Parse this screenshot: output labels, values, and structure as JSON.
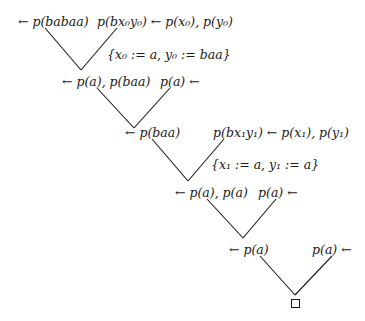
{
  "diagram": {
    "type": "SLD-refutation-tree",
    "nodes": [
      {
        "id": "goal0",
        "text": "← p(babaa)",
        "x": 18,
        "y": 15
      },
      {
        "id": "clause0",
        "text": "p(bx₀y₀) ← p(x₀), p(y₀)",
        "x": 97,
        "y": 15
      },
      {
        "id": "subst0",
        "text": "{x₀ := a, y₀ := baa}",
        "x": 107,
        "y": 48
      },
      {
        "id": "goal1",
        "text": "← p(a), p(baa)",
        "x": 62,
        "y": 75
      },
      {
        "id": "fact1",
        "text": "p(a) ←",
        "x": 160,
        "y": 75
      },
      {
        "id": "goal2",
        "text": "← p(baa)",
        "x": 125,
        "y": 126
      },
      {
        "id": "clause2",
        "text": "p(bx₁y₁) ← p(x₁), p(y₁)",
        "x": 213,
        "y": 126
      },
      {
        "id": "subst2",
        "text": "{x₁ := a, y₁ := a}",
        "x": 211,
        "y": 158
      },
      {
        "id": "goal3",
        "text": "← p(a), p(a)",
        "x": 175,
        "y": 186
      },
      {
        "id": "fact3",
        "text": "p(a) ←",
        "x": 258,
        "y": 186
      },
      {
        "id": "goal4",
        "text": "← p(a)",
        "x": 229,
        "y": 243
      },
      {
        "id": "fact4",
        "text": "p(a) ←",
        "x": 312,
        "y": 243
      }
    ],
    "edges": [
      {
        "from": "goal0",
        "to": "goal1",
        "x1": 45,
        "y1": 28,
        "x2": 81,
        "y2": 70
      },
      {
        "from": "clause0",
        "to": "goal1",
        "x1": 117,
        "y1": 28,
        "x2": 81,
        "y2": 70
      },
      {
        "from": "goal1",
        "to": "goal2",
        "x1": 97,
        "y1": 88,
        "x2": 134,
        "y2": 128
      },
      {
        "from": "fact1",
        "to": "goal2",
        "x1": 170,
        "y1": 88,
        "x2": 134,
        "y2": 128
      },
      {
        "from": "goal2",
        "to": "goal3",
        "x1": 152,
        "y1": 139,
        "x2": 188,
        "y2": 181
      },
      {
        "from": "clause2",
        "to": "goal3",
        "x1": 224,
        "y1": 139,
        "x2": 188,
        "y2": 181
      },
      {
        "from": "goal3",
        "to": "goal4",
        "x1": 207,
        "y1": 199,
        "x2": 243,
        "y2": 238
      },
      {
        "from": "fact3",
        "to": "goal4",
        "x1": 276,
        "y1": 199,
        "x2": 243,
        "y2": 238
      },
      {
        "from": "goal4",
        "to": "empty",
        "x1": 260,
        "y1": 256,
        "x2": 295,
        "y2": 295
      },
      {
        "from": "fact4",
        "to": "empty",
        "x1": 332,
        "y1": 256,
        "x2": 295,
        "y2": 295
      }
    ],
    "empty_clause": {
      "symbol": "□",
      "x": 291,
      "y": 299
    }
  }
}
